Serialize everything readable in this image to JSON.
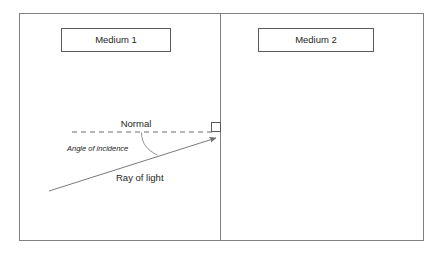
{
  "diagram": {
    "colors": {
      "frame_stroke": "#808080",
      "divider_stroke": "#808080",
      "box_stroke": "#5a5a5a",
      "ray_stroke": "#7a7a7a",
      "normal_stroke": "#6e6e6e",
      "arc_stroke": "#8a8a8a",
      "right_angle_stroke": "#5a5a5a",
      "text": "#262626",
      "background": "#ffffff"
    },
    "boxes": [
      {
        "name": "medium-1-box",
        "label": "Medium 1"
      },
      {
        "name": "medium-2-box",
        "label": "Medium 2"
      }
    ],
    "labels": {
      "normal": "Normal",
      "angle_of_incidence": "Angle of incidence",
      "ray_of_light": "Ray of light"
    },
    "elements": {
      "outer_frame": "outer-frame",
      "divider": "medium-boundary-divider",
      "normal_line": "normal-dashed-line",
      "incident_ray": "incident-ray-arrow",
      "angle_arc": "angle-of-incidence-arc",
      "right_angle_marker": "right-angle-marker"
    }
  }
}
